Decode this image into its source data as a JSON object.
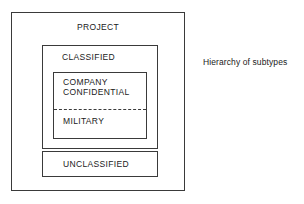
{
  "diagram": {
    "caption": "Hierarchy of subtypes",
    "outer": {
      "label": "PROJECT",
      "children": [
        {
          "label": "CLASSIFIED",
          "children": [
            {
              "label_line1": "COMPANY",
              "label_line2": "CONFIDENTIAL"
            },
            {
              "label": "MILITARY"
            }
          ]
        },
        {
          "label": "UNCLASSIFIED"
        }
      ]
    }
  },
  "colors": {
    "background": "#ffffff",
    "stroke": "#3a3a3a",
    "text": "#1a1a1a"
  }
}
